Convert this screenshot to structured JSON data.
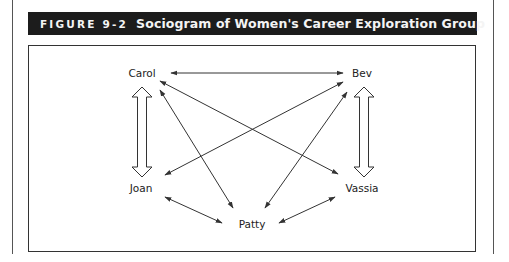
{
  "figure": {
    "number": "FIGURE 9-2",
    "title": "Sociogram of Women's Career Exploration Group"
  },
  "nodes": [
    {
      "id": "carol",
      "label": "Carol",
      "x": 142,
      "y": 73
    },
    {
      "id": "bev",
      "label": "Bev",
      "x": 362,
      "y": 73
    },
    {
      "id": "joan",
      "label": "Joan",
      "x": 141,
      "y": 188
    },
    {
      "id": "vassia",
      "label": "Vassia",
      "x": 362,
      "y": 188
    },
    {
      "id": "patty",
      "label": "Patty",
      "x": 252,
      "y": 224
    }
  ],
  "edges": [
    {
      "from": "Carol",
      "to": "Bev",
      "type": "mutual",
      "style": "line"
    },
    {
      "from": "Carol",
      "to": "Joan",
      "type": "mutual",
      "style": "hollow-double-arrow"
    },
    {
      "from": "Bev",
      "to": "Vassia",
      "type": "mutual",
      "style": "hollow-double-arrow"
    },
    {
      "from": "Carol",
      "to": "Vassia",
      "type": "mutual",
      "style": "line"
    },
    {
      "from": "Carol",
      "to": "Patty",
      "type": "mutual",
      "style": "line"
    },
    {
      "from": "Bev",
      "to": "Joan",
      "type": "mutual",
      "style": "line"
    },
    {
      "from": "Bev",
      "to": "Patty",
      "type": "mutual",
      "style": "line"
    },
    {
      "from": "Joan",
      "to": "Patty",
      "type": "mutual",
      "style": "line"
    },
    {
      "from": "Patty",
      "to": "Vassia",
      "type": "mutual",
      "style": "line"
    }
  ],
  "colors": {
    "header_bg": "#1c1c1c",
    "header_text": "#f4f4f4",
    "line": "#333333"
  }
}
